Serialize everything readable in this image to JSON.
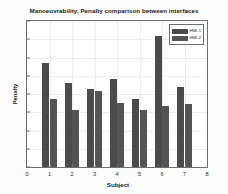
{
  "chart_data": {
    "type": "bar",
    "title": "Manoeuvrability, Penalty comparison between interfaces",
    "xlabel": "Subject",
    "ylabel": "Penalty",
    "categories": [
      "1",
      "2",
      "3",
      "4",
      "5",
      "6",
      "7"
    ],
    "series": [
      {
        "name": "HMI-1",
        "color": "#4b4b4b",
        "values": [
          57,
          46,
          43,
          48,
          37,
          72,
          44
        ]
      },
      {
        "name": "HMI-2",
        "color": "#545454",
        "values": [
          37,
          31,
          41.5,
          35,
          31.5,
          33.5,
          34.5
        ]
      }
    ],
    "xlim": [
      0,
      8
    ],
    "ylim": [
      0,
      80
    ],
    "xticks": [
      "0",
      "1",
      "2",
      "3",
      "4",
      "5",
      "6",
      "7",
      "8"
    ],
    "yticks": [
      "0",
      "10",
      "20",
      "30",
      "40",
      "50",
      "60",
      "70",
      "80"
    ],
    "grid": true,
    "legend_position": "top-right"
  }
}
